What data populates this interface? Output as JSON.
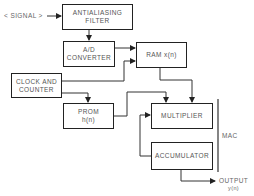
{
  "diagram": {
    "input": {
      "label": "< SIGNAL >"
    },
    "blocks": {
      "filter": {
        "line1": "ANTIALIASING",
        "line2": "FILTER"
      },
      "adc": {
        "line1": "A/D",
        "line2": "CONVERTER"
      },
      "ram": {
        "line1": "RAM x(n)"
      },
      "clock": {
        "line1": "CLOCK AND",
        "line2": "COUNTER"
      },
      "prom": {
        "line1": "PROM",
        "line2": "h(n)"
      },
      "multiplier": {
        "line1": "MULTIPLIER"
      },
      "accumulator": {
        "line1": "ACCUMULATOR"
      }
    },
    "group": {
      "label": "MAC"
    },
    "output": {
      "line1": "OUTPUT",
      "line2": "y(n)"
    }
  }
}
